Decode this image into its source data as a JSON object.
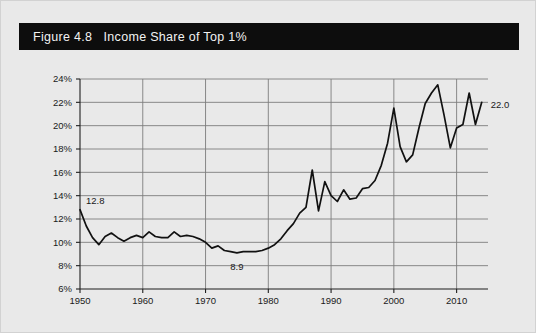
{
  "figure": {
    "title": "Figure 4.8   Income Share of Top 1%",
    "title_bar_color": "#0d0d0d",
    "title_text_color": "#f2f2f2",
    "background_color": "#e9e9e9"
  },
  "chart_data": {
    "type": "line",
    "title": "Income Share of Top 1%",
    "xlabel": "",
    "ylabel": "",
    "xlim": [
      1950,
      2015
    ],
    "ylim": [
      6,
      24
    ],
    "grid": true,
    "legend": false,
    "y_tick_labels": [
      "6%",
      "8%",
      "10%",
      "12%",
      "14%",
      "16%",
      "18%",
      "20%",
      "22%",
      "24%"
    ],
    "y_tick_values": [
      6,
      8,
      10,
      12,
      14,
      16,
      18,
      20,
      22,
      24
    ],
    "x_tick_labels": [
      "1950",
      "1960",
      "1970",
      "1980",
      "1990",
      "2000",
      "2010"
    ],
    "x_tick_values": [
      1950,
      1960,
      1970,
      1980,
      1990,
      2000,
      2010
    ],
    "series_name": "Income Share of Top 1%",
    "series_color": "#111111",
    "x": [
      1950,
      1951,
      1952,
      1953,
      1954,
      1955,
      1956,
      1957,
      1958,
      1959,
      1960,
      1961,
      1962,
      1963,
      1964,
      1965,
      1966,
      1967,
      1968,
      1969,
      1970,
      1971,
      1972,
      1973,
      1974,
      1975,
      1976,
      1977,
      1978,
      1979,
      1980,
      1981,
      1982,
      1983,
      1984,
      1985,
      1986,
      1987,
      1988,
      1989,
      1990,
      1991,
      1992,
      1993,
      1994,
      1995,
      1996,
      1997,
      1998,
      1999,
      2000,
      2001,
      2002,
      2003,
      2004,
      2005,
      2006,
      2007,
      2008,
      2009,
      2010,
      2011,
      2012,
      2013,
      2014
    ],
    "values": [
      12.8,
      11.4,
      10.4,
      9.8,
      10.5,
      10.8,
      10.4,
      10.1,
      10.4,
      10.6,
      10.4,
      10.9,
      10.5,
      10.4,
      10.4,
      10.9,
      10.5,
      10.6,
      10.5,
      10.3,
      10.0,
      9.5,
      9.7,
      9.3,
      9.2,
      9.1,
      9.2,
      9.2,
      9.2,
      9.3,
      9.5,
      9.8,
      10.3,
      11.0,
      11.6,
      12.5,
      13.0,
      16.2,
      12.7,
      15.2,
      14.0,
      13.5,
      14.5,
      13.7,
      13.8,
      14.6,
      14.7,
      15.3,
      16.6,
      18.5,
      21.5,
      18.2,
      16.9,
      17.5,
      19.8,
      21.9,
      22.8,
      23.5,
      20.9,
      18.1,
      19.8,
      20.1,
      22.8,
      20.1,
      22.0
    ],
    "annotations": [
      {
        "label": "12.8",
        "x": 1950,
        "y": 12.8,
        "position": "above-right"
      },
      {
        "label": "8.9",
        "x": 1975,
        "y": 8.9,
        "position": "below"
      },
      {
        "label": "22.0",
        "x": 2014,
        "y": 22.0,
        "position": "below-right"
      }
    ]
  }
}
